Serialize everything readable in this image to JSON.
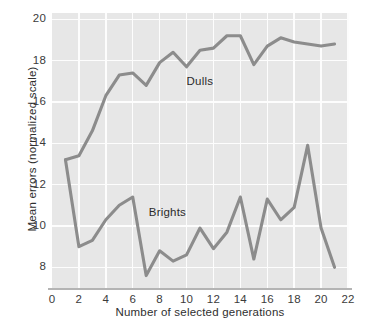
{
  "chart_data": {
    "type": "line",
    "title": "",
    "xlabel": "Number of selected generations",
    "ylabel": "Mean errors (normalized scale)",
    "xlim": [
      0,
      22
    ],
    "ylim": [
      7,
      20.3
    ],
    "grid": true,
    "xticks": [
      0,
      2,
      4,
      6,
      8,
      10,
      12,
      14,
      16,
      18,
      20,
      22
    ],
    "xtick_labels": [
      "0",
      "2",
      "4",
      "6",
      "8",
      "10",
      "12",
      "14",
      "16",
      "18",
      "20",
      "22"
    ],
    "yticks": [
      8,
      10,
      12,
      14,
      16,
      18,
      20
    ],
    "ytick_labels": [
      "8",
      "10",
      "12",
      "14",
      "16",
      "18",
      "20"
    ],
    "legend_position": "inline-annotations",
    "line_color": "#8c8c8c",
    "panel_color": "#e7e7e7",
    "gridline_color": "#fdfdfd",
    "x": [
      1,
      2,
      3,
      4,
      5,
      6,
      7,
      8,
      9,
      10,
      11,
      12,
      13,
      14,
      15,
      16,
      17,
      18,
      19,
      20,
      21
    ],
    "series": [
      {
        "name": "Dulls",
        "label_x": 10.0,
        "label_y": 16.9,
        "values": [
          13.2,
          13.4,
          14.6,
          16.3,
          17.3,
          17.4,
          16.8,
          17.9,
          18.4,
          17.7,
          18.5,
          18.6,
          19.2,
          19.2,
          17.8,
          18.7,
          19.1,
          18.9,
          18.8,
          18.7,
          18.8
        ]
      },
      {
        "name": "Brights",
        "label_x": 7.2,
        "label_y": 10.6,
        "values": [
          13.2,
          9.0,
          9.3,
          10.3,
          11.0,
          11.4,
          7.6,
          8.8,
          8.3,
          8.6,
          9.9,
          8.9,
          9.7,
          11.4,
          8.4,
          11.3,
          10.3,
          10.9,
          13.9,
          9.9,
          8.0
        ]
      }
    ]
  },
  "axis_titles": {
    "x": "Number of selected generations",
    "y": "Mean errors (normalized scale)"
  }
}
